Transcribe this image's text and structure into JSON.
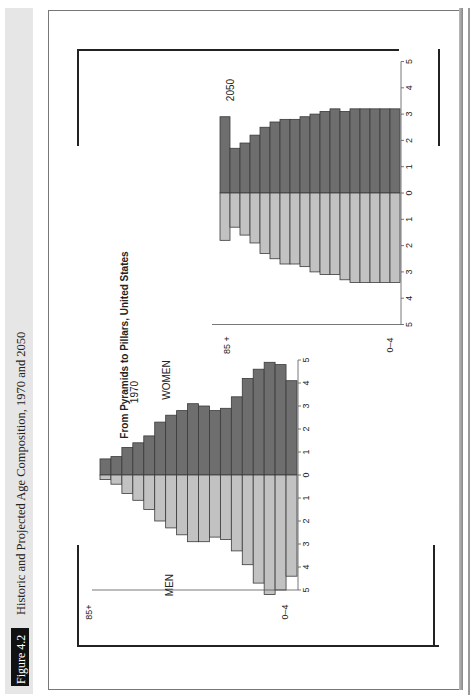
{
  "figure": {
    "number_label": "Figure 4.2",
    "caption": "Historic and Projected Age Composition, 1970 and 2050"
  },
  "chart_title": "From Pyramids to Pillars, United States",
  "colors": {
    "women": "#6e6e6e",
    "men": "#c2c2c2",
    "outline": "#3a3a3a",
    "sidebar": "#e6e6e6",
    "tag": "#111111"
  },
  "chart_data": [
    {
      "type": "bar",
      "orientation": "population-pyramid (rotated 90° on page)",
      "title": "1970",
      "categories": [
        "85+",
        "80-84",
        "75-79",
        "70-74",
        "65-69",
        "60-64",
        "55-59",
        "50-54",
        "45-49",
        "40-44",
        "35-39",
        "30-34",
        "25-29",
        "20-24",
        "15-19",
        "10-14",
        "5-9",
        "0-4"
      ],
      "category_axis_labels": {
        "top": "85+",
        "bottom": "0–4"
      },
      "series": [
        {
          "name": "WOMEN",
          "values": [
            0.7,
            0.8,
            1.2,
            1.4,
            1.7,
            2.3,
            2.6,
            2.8,
            3.1,
            3.0,
            2.8,
            2.9,
            3.4,
            4.2,
            4.6,
            4.9,
            4.8,
            4.1
          ]
        },
        {
          "name": "MEN",
          "values": [
            0.2,
            0.4,
            0.8,
            1.1,
            1.5,
            2.0,
            2.3,
            2.6,
            2.9,
            2.9,
            2.7,
            2.8,
            3.3,
            3.9,
            4.7,
            5.2,
            5.0,
            4.4
          ]
        }
      ],
      "value_ticks": [
        5,
        4,
        3,
        2,
        1,
        0,
        1,
        2,
        3,
        4,
        5
      ],
      "xlim": [
        -5,
        5
      ],
      "labels": {
        "women": "WOMEN",
        "men": "MEN",
        "year": "1970"
      }
    },
    {
      "type": "bar",
      "orientation": "population-pyramid (rotated 90° on page)",
      "title": "2050",
      "categories": [
        "85+",
        "80-84",
        "75-79",
        "70-74",
        "65-69",
        "60-64",
        "55-59",
        "50-54",
        "45-49",
        "40-44",
        "35-39",
        "30-34",
        "25-29",
        "20-24",
        "15-19",
        "10-14",
        "5-9",
        "0-4"
      ],
      "category_axis_labels": {
        "top": "85 +",
        "bottom": "0–4"
      },
      "series": [
        {
          "name": "WOMEN",
          "values": [
            2.9,
            1.7,
            1.9,
            2.2,
            2.5,
            2.7,
            2.8,
            2.8,
            2.9,
            3.0,
            3.1,
            3.2,
            3.1,
            3.2,
            3.2,
            3.2,
            3.2,
            3.2
          ]
        },
        {
          "name": "MEN",
          "values": [
            1.8,
            1.3,
            1.6,
            1.9,
            2.3,
            2.5,
            2.7,
            2.7,
            2.8,
            3.0,
            3.1,
            3.1,
            3.3,
            3.4,
            3.4,
            3.4,
            3.4,
            3.4
          ]
        }
      ],
      "value_ticks": [
        5,
        4,
        3,
        2,
        1,
        0,
        1,
        2,
        3,
        4,
        5
      ],
      "xlim": [
        -5,
        5
      ],
      "labels": {
        "year": "2050"
      }
    }
  ]
}
